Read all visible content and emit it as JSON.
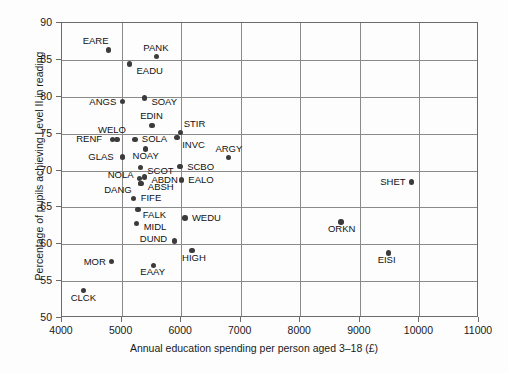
{
  "chart_data": {
    "type": "scatter",
    "title": "",
    "xlabel": "Annual education spending per person aged 3–18 (£)",
    "ylabel": "Percentage of pupils achieving Level II in reading",
    "xlim": [
      4000,
      11000
    ],
    "ylim": [
      50,
      90
    ],
    "xticks": [
      4000,
      5000,
      6000,
      7000,
      8000,
      9000,
      10000,
      11000
    ],
    "yticks": [
      50,
      55,
      60,
      65,
      70,
      75,
      80,
      85,
      90
    ],
    "grid": true,
    "legend": "none",
    "points": [
      {
        "label": "EARE",
        "x": 4800,
        "y": 86.2,
        "lx": -26,
        "ly": -14
      },
      {
        "label": "PANK",
        "x": 5600,
        "y": 85.3,
        "lx": -13,
        "ly": -14
      },
      {
        "label": "EADU",
        "x": 5150,
        "y": 84.3,
        "lx": 7,
        "ly": 2
      },
      {
        "label": "ANGS",
        "x": 5030,
        "y": 79.2,
        "lx": -33,
        "ly": -5
      },
      {
        "label": "SOAY",
        "x": 5400,
        "y": 79.7,
        "lx": 7,
        "ly": -1
      },
      {
        "label": "EDIN",
        "x": 5530,
        "y": 76.0,
        "lx": -12,
        "ly": -14
      },
      {
        "label": "STIR",
        "x": 6010,
        "y": 75.0,
        "lx": 3,
        "ly": -14
      },
      {
        "label": "WELO",
        "x": 4940,
        "y": 74.1,
        "lx": -19,
        "ly": -14
      },
      {
        "label": "RENF",
        "x": 4860,
        "y": 74.1,
        "lx": -36,
        "ly": -5
      },
      {
        "label": "SOLA",
        "x": 5240,
        "y": 74.1,
        "lx": 7,
        "ly": -5
      },
      {
        "label": "INVC",
        "x": 5950,
        "y": 74.3,
        "lx": 5,
        "ly": 2
      },
      {
        "label": "NOAY",
        "x": 5420,
        "y": 72.8,
        "lx": -13,
        "ly": 2
      },
      {
        "label": "ARGY",
        "x": 6810,
        "y": 71.6,
        "lx": -13,
        "ly": -14
      },
      {
        "label": "GLAS",
        "x": 5030,
        "y": 71.7,
        "lx": -34,
        "ly": -5
      },
      {
        "label": "SCOT",
        "x": 5330,
        "y": 70.3,
        "lx": 7,
        "ly": -1
      },
      {
        "label": "SCBO",
        "x": 6000,
        "y": 70.4,
        "lx": 7,
        "ly": -5
      },
      {
        "label": "ABDN",
        "x": 5400,
        "y": 69.0,
        "lx": 7,
        "ly": -2
      },
      {
        "label": "NOLA",
        "x": 5320,
        "y": 68.8,
        "lx": -32,
        "ly": -8
      },
      {
        "label": "EALO",
        "x": 6020,
        "y": 68.6,
        "lx": 7,
        "ly": -5
      },
      {
        "label": "ABSH",
        "x": 5340,
        "y": 68.1,
        "lx": 7,
        "ly": -2
      },
      {
        "label": "DANG",
        "x": 5330,
        "y": 68.1,
        "lx": -36,
        "ly": 1
      },
      {
        "label": "FIFE",
        "x": 5220,
        "y": 66.1,
        "lx": 7,
        "ly": -5
      },
      {
        "label": "FALK",
        "x": 5290,
        "y": 64.6,
        "lx": 5,
        "ly": 1
      },
      {
        "label": "WEDU",
        "x": 6080,
        "y": 63.4,
        "lx": 7,
        "ly": -5
      },
      {
        "label": "MIDL",
        "x": 5270,
        "y": 62.7,
        "lx": 7,
        "ly": -1
      },
      {
        "label": "ORKN",
        "x": 8700,
        "y": 62.9,
        "lx": -13,
        "ly": 2
      },
      {
        "label": "DUND",
        "x": 5910,
        "y": 60.3,
        "lx": -35,
        "ly": -7
      },
      {
        "label": "HIGH",
        "x": 6200,
        "y": 59.0,
        "lx": -10,
        "ly": 2
      },
      {
        "label": "SHET",
        "x": 9880,
        "y": 68.3,
        "lx": -31,
        "ly": -5
      },
      {
        "label": "EISI",
        "x": 9500,
        "y": 58.7,
        "lx": -11,
        "ly": 2
      },
      {
        "label": "MOR",
        "x": 4850,
        "y": 57.5,
        "lx": -28,
        "ly": -5
      },
      {
        "label": "EAAY",
        "x": 5550,
        "y": 57.0,
        "lx": -13,
        "ly": 2
      },
      {
        "label": "CLCK",
        "x": 4380,
        "y": 53.6,
        "lx": -13,
        "ly": 3
      }
    ]
  },
  "colors": {
    "point": "#3b3b3b",
    "grid": "#8a8a8a",
    "frame": "#6b6b6b",
    "background": "#fdfdfd"
  }
}
